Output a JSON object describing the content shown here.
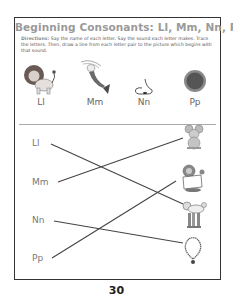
{
  "worksheet": {
    "title": "Beginning Consonants:  Ll, Mm, Nn, Pp",
    "directions_label": "Directions:",
    "directions_text": " Say the name of each letter. Say the sound each letter makes. Trace the letters. Then, draw a line from each letter pair to the picture which begins with that sound."
  },
  "top_row": [
    {
      "letter": "Ll",
      "picture": "lion"
    },
    {
      "letter": "Mm",
      "picture": "mermaid"
    },
    {
      "letter": "Nn",
      "picture": "nose"
    },
    {
      "letter": "Pp",
      "picture": "pizza"
    }
  ],
  "matching": {
    "letters": [
      "Ll",
      "Mm",
      "Nn",
      "Pp"
    ],
    "pictures": [
      "mouse",
      "puppet",
      "poodle",
      "necklace"
    ],
    "connections": [
      {
        "from": "Ll",
        "to": "poodle"
      },
      {
        "from": "Mm",
        "to": "mouse"
      },
      {
        "from": "Nn",
        "to": "necklace"
      },
      {
        "from": "Pp",
        "to": "puppet"
      }
    ]
  },
  "page_number": "30",
  "colors": {
    "title": "#9a9a9a",
    "border": "#333333",
    "line": "#444444",
    "letters": "#777777"
  }
}
